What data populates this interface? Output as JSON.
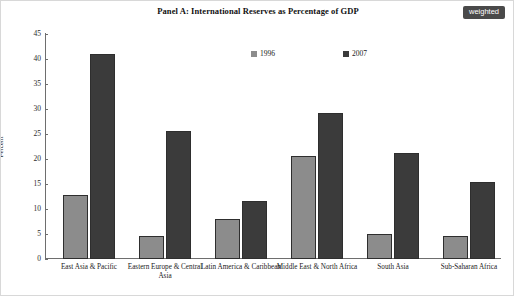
{
  "title": "Panel A: International Reserves as Percentage of GDP",
  "badge": {
    "label": "weighted"
  },
  "colors": {
    "series_1996": "#8c8c8c",
    "series_2007": "#3b3b3b",
    "axis": "#6e6e6e",
    "badge_bg": "#4a4a4a",
    "badge_text": "#ffffff"
  },
  "chart_data": {
    "type": "bar",
    "title": "Panel A: International Reserves as Percentage of GDP",
    "xlabel": "",
    "ylabel": "Percent",
    "ylim": [
      0,
      45
    ],
    "yticks": [
      0,
      5,
      10,
      15,
      20,
      25,
      30,
      35,
      40,
      45
    ],
    "ytick_labels": [
      "0",
      "5",
      "10",
      "15",
      "20",
      "25",
      "30",
      "35",
      "40",
      "45"
    ],
    "grid": false,
    "legend_position": "top-center",
    "categories": [
      "East Asia & Pacific",
      "Eastern Europe & Central Asia",
      "Latin America & Caribbean",
      "Middle East & North Africa",
      "South Asia",
      "Sub-Saharan Africa"
    ],
    "series": [
      {
        "name": "1996",
        "color": "#8c8c8c",
        "values": [
          12.9,
          4.6,
          8.0,
          20.6,
          5.0,
          4.6
        ]
      },
      {
        "name": "2007",
        "color": "#3b3b3b",
        "values": [
          41.0,
          25.6,
          11.7,
          29.3,
          21.2,
          15.4
        ]
      }
    ]
  }
}
